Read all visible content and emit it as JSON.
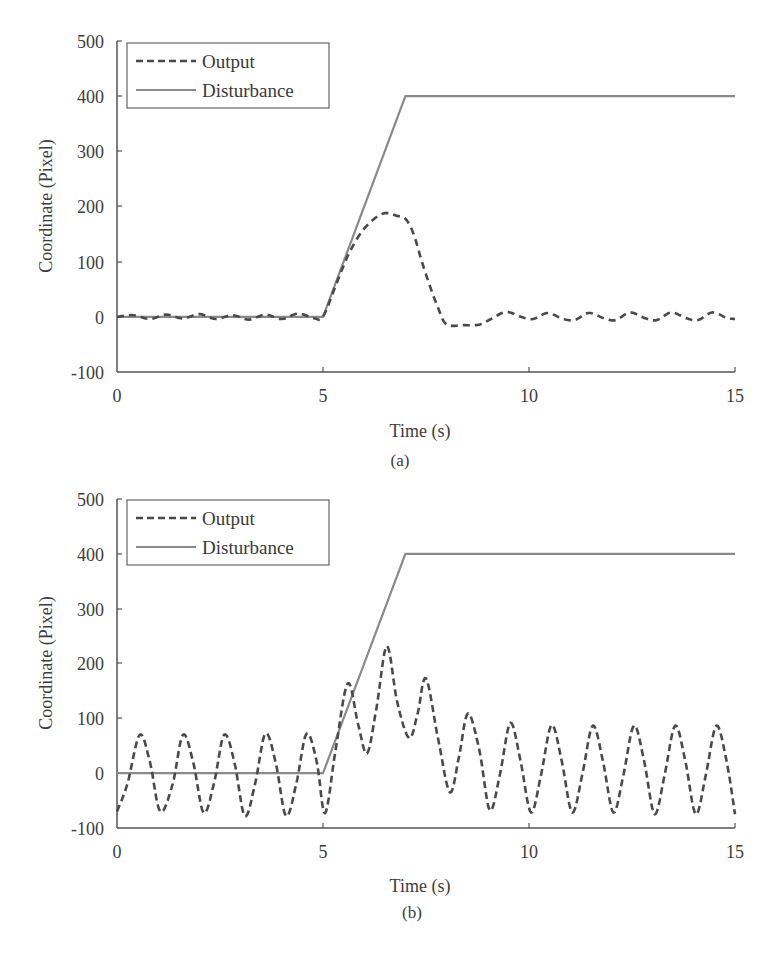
{
  "chart_data": [
    {
      "panel": "(a)",
      "type": "line",
      "title": "",
      "xlabel": "Time (s)",
      "ylabel": "Coordinate (Pixel)",
      "caption": "(a)",
      "xlim": [
        0,
        15
      ],
      "ylim": [
        -100,
        500
      ],
      "xticks": [
        0,
        5,
        10,
        15
      ],
      "yticks": [
        -100,
        0,
        100,
        200,
        300,
        400,
        500
      ],
      "xtick_labels": [
        "0",
        "5",
        "10",
        "15"
      ],
      "ytick_labels": [
        "-100",
        "0",
        "100",
        "200",
        "300",
        "400",
        "500"
      ],
      "grid": false,
      "legend_position": "upper left",
      "series": [
        {
          "name": "Output",
          "style": "dashed",
          "color": "#4a4a4a",
          "x": [
            0,
            0.4,
            0.8,
            1.2,
            1.6,
            2.0,
            2.4,
            2.8,
            3.2,
            3.6,
            4.0,
            4.4,
            4.8,
            5.0,
            5.3,
            5.6,
            5.9,
            6.2,
            6.5,
            6.8,
            7.0,
            7.2,
            7.4,
            7.6,
            7.8,
            8.0,
            8.4,
            8.8,
            9.1,
            9.45,
            9.8,
            10.1,
            10.45,
            10.8,
            11.1,
            11.45,
            11.8,
            12.1,
            12.45,
            12.8,
            13.1,
            13.45,
            13.8,
            14.1,
            14.45,
            14.8,
            15.0
          ],
          "y": [
            0,
            3,
            -4,
            4,
            -3,
            5,
            -4,
            3,
            -5,
            4,
            -4,
            6,
            -3,
            0,
            55,
            110,
            150,
            175,
            188,
            183,
            178,
            150,
            100,
            55,
            15,
            -14,
            -15,
            -14,
            -3,
            9,
            0,
            -4,
            7,
            -3,
            -6,
            7,
            -2,
            -6,
            8,
            -2,
            -6,
            8,
            -2,
            -6,
            8,
            -2,
            -4
          ]
        },
        {
          "name": "Disturbance",
          "style": "solid",
          "color": "#8a8a8a",
          "x": [
            0,
            5,
            7,
            15
          ],
          "y": [
            0,
            0,
            400,
            400
          ]
        }
      ]
    },
    {
      "panel": "(b)",
      "type": "line",
      "title": "",
      "xlabel": "Time (s)",
      "ylabel": "Coordinate (Pixel)",
      "caption": "(b)",
      "xlim": [
        0,
        15
      ],
      "ylim": [
        -100,
        500
      ],
      "xticks": [
        0,
        5,
        10,
        15
      ],
      "yticks": [
        -100,
        0,
        100,
        200,
        300,
        400,
        500
      ],
      "xtick_labels": [
        "0",
        "5",
        "10",
        "15"
      ],
      "ytick_labels": [
        "-100",
        "0",
        "100",
        "200",
        "300",
        "400",
        "500"
      ],
      "grid": false,
      "legend_position": "upper left",
      "series": [
        {
          "name": "Output",
          "style": "dashed",
          "color": "#4a4a4a",
          "x": [
            0,
            0.25,
            0.55,
            0.8,
            1.05,
            1.35,
            1.6,
            1.85,
            2.1,
            2.35,
            2.6,
            2.85,
            3.1,
            3.35,
            3.6,
            3.85,
            4.1,
            4.35,
            4.6,
            4.85,
            5.05,
            5.3,
            5.6,
            5.85,
            6.07,
            6.3,
            6.55,
            6.8,
            7.09,
            7.3,
            7.5,
            7.8,
            8.08,
            8.3,
            8.52,
            8.8,
            9.05,
            9.3,
            9.55,
            9.8,
            10.05,
            10.3,
            10.55,
            10.8,
            11.05,
            11.3,
            11.55,
            11.8,
            12.05,
            12.3,
            12.55,
            12.8,
            13.05,
            13.3,
            13.55,
            13.8,
            14.05,
            14.3,
            14.55,
            14.8,
            15.0
          ],
          "y": [
            -70,
            -20,
            70,
            20,
            -70,
            -20,
            70,
            20,
            -72,
            -20,
            70,
            20,
            -78,
            -20,
            72,
            20,
            -78,
            -20,
            72,
            20,
            -73,
            40,
            164,
            90,
            36,
            120,
            232,
            130,
            64,
            110,
            173,
            60,
            -35,
            30,
            109,
            40,
            -68,
            0,
            92,
            20,
            -72,
            0,
            88,
            20,
            -72,
            0,
            87,
            20,
            -72,
            0,
            87,
            20,
            -75,
            0,
            87,
            20,
            -75,
            0,
            87,
            20,
            -75
          ]
        },
        {
          "name": "Disturbance",
          "style": "solid",
          "color": "#8a8a8a",
          "x": [
            0,
            5,
            7,
            15
          ],
          "y": [
            0,
            0,
            400,
            400
          ]
        }
      ]
    }
  ],
  "figures": {
    "a": {
      "caption": "(a)",
      "xlabel": "Time (s)",
      "ylabel": "Coordinate (Pixel)",
      "legend": {
        "output": "Output",
        "disturbance": "Disturbance"
      },
      "xtick_labels": [
        "0",
        "5",
        "10",
        "15"
      ],
      "ytick_labels": [
        "500",
        "400",
        "300",
        "200",
        "100",
        "0",
        "-100"
      ]
    },
    "b": {
      "caption": "(b)",
      "xlabel": "Time (s)",
      "ylabel": "Coordinate (Pixel)",
      "legend": {
        "output": "Output",
        "disturbance": "Disturbance"
      },
      "xtick_labels": [
        "0",
        "5",
        "10",
        "15"
      ],
      "ytick_labels": [
        "500",
        "400",
        "300",
        "200",
        "100",
        "0",
        "-100"
      ]
    }
  },
  "colors": {
    "output": "#4a4a4a",
    "disturbance": "#8a8a8a",
    "axis": "#555555"
  }
}
